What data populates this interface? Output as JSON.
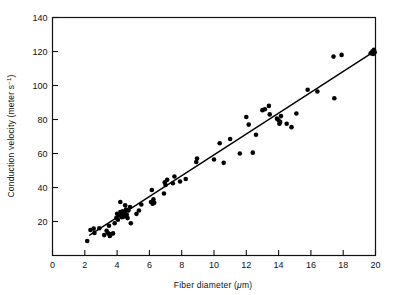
{
  "figure": {
    "background_color": "#ffffff",
    "ink_color": "#111111",
    "marker_color": "#000000",
    "fit_line_color": "#000000"
  },
  "chart_data": {
    "type": "scatter",
    "title": "",
    "xlabel": "Fiber diameter (μm)",
    "xlabel_parts": {
      "prefix": "Fiber diameter (",
      "unit_italic": "μ",
      "unit_rest": "m)"
    },
    "ylabel": "Conduction velocity (meter s⁻¹)",
    "ylabel_parts": {
      "prefix": "Conduction velocity (meter s",
      "exponent": "−1",
      "suffix": ")"
    },
    "xlim": [
      0,
      20
    ],
    "ylim": [
      0,
      140
    ],
    "xticks": [
      0,
      2,
      4,
      6,
      8,
      10,
      12,
      14,
      16,
      18,
      20
    ],
    "yticks": [
      0,
      20,
      40,
      60,
      80,
      100,
      120,
      140
    ],
    "xtick_labels": [
      "0",
      "2",
      "4",
      "6",
      "8",
      "10",
      "12",
      "14",
      "16",
      "18",
      "20"
    ],
    "ytick_labels": [
      "",
      "20",
      "40",
      "60",
      "80",
      "100",
      "120",
      "140"
    ],
    "grid": false,
    "legend": null,
    "tick_direction": "inward",
    "frame": "box",
    "marker": {
      "shape": "circle",
      "size_px": 4.6,
      "color": "#000000"
    },
    "fit_line": {
      "label": "linear fit",
      "x_start": 2.3,
      "y_start": 12.0,
      "x_end": 20.0,
      "y_end": 120.5,
      "slope": 6.13,
      "intercept": -2.1,
      "width_px": 1.4
    },
    "points": [
      [
        2.15,
        8.5
      ],
      [
        2.35,
        15.0
      ],
      [
        2.55,
        15.8
      ],
      [
        2.6,
        13.2
      ],
      [
        2.9,
        16.0
      ],
      [
        3.2,
        12.0
      ],
      [
        3.35,
        14.6
      ],
      [
        3.45,
        13.0
      ],
      [
        3.5,
        17.5
      ],
      [
        3.55,
        11.5
      ],
      [
        3.6,
        12.4
      ],
      [
        3.75,
        13.0
      ],
      [
        3.85,
        19.0
      ],
      [
        3.95,
        22.0
      ],
      [
        4.0,
        24.5
      ],
      [
        4.05,
        21.0
      ],
      [
        4.1,
        23.5
      ],
      [
        4.2,
        25.5
      ],
      [
        4.25,
        24.0
      ],
      [
        4.3,
        22.5
      ],
      [
        4.35,
        26.0
      ],
      [
        4.4,
        24.3
      ],
      [
        4.45,
        23.0
      ],
      [
        4.5,
        25.0
      ],
      [
        4.55,
        27.0
      ],
      [
        4.6,
        24.0
      ],
      [
        4.65,
        22.0
      ],
      [
        4.7,
        26.5
      ],
      [
        4.8,
        28.5
      ],
      [
        4.85,
        19.0
      ],
      [
        4.2,
        31.5
      ],
      [
        4.5,
        29.5
      ],
      [
        5.2,
        24.5
      ],
      [
        5.35,
        26.5
      ],
      [
        5.5,
        30.0
      ],
      [
        6.1,
        31.5
      ],
      [
        6.2,
        30.5
      ],
      [
        6.25,
        33.0
      ],
      [
        6.3,
        31.0
      ],
      [
        6.15,
        38.5
      ],
      [
        6.9,
        36.5
      ],
      [
        6.95,
        43.0
      ],
      [
        7.0,
        41.5
      ],
      [
        7.1,
        44.5
      ],
      [
        7.45,
        42.5
      ],
      [
        7.55,
        46.5
      ],
      [
        7.9,
        43.5
      ],
      [
        8.25,
        45.0
      ],
      [
        8.9,
        55.0
      ],
      [
        8.95,
        57.0
      ],
      [
        10.0,
        56.5
      ],
      [
        10.35,
        66.0
      ],
      [
        10.6,
        54.5
      ],
      [
        11.0,
        68.5
      ],
      [
        11.6,
        60.0
      ],
      [
        12.0,
        81.5
      ],
      [
        12.15,
        77.0
      ],
      [
        12.4,
        60.5
      ],
      [
        12.6,
        71.0
      ],
      [
        13.0,
        85.5
      ],
      [
        13.15,
        86.0
      ],
      [
        13.4,
        88.0
      ],
      [
        13.45,
        83.0
      ],
      [
        13.9,
        80.5
      ],
      [
        14.0,
        79.5
      ],
      [
        14.05,
        77.5
      ],
      [
        14.1,
        78.5
      ],
      [
        14.15,
        82.0
      ],
      [
        14.5,
        77.5
      ],
      [
        14.8,
        75.5
      ],
      [
        15.1,
        83.5
      ],
      [
        15.8,
        97.5
      ],
      [
        16.4,
        96.5
      ],
      [
        17.4,
        117.0
      ],
      [
        17.45,
        92.5
      ],
      [
        17.9,
        118.0
      ],
      [
        19.7,
        119.0
      ],
      [
        19.8,
        120.0
      ],
      [
        19.85,
        118.5
      ],
      [
        19.9,
        121.0
      ],
      [
        19.95,
        119.5
      ]
    ]
  }
}
